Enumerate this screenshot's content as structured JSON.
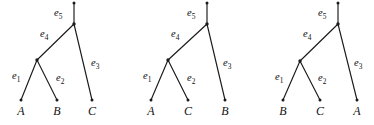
{
  "figure": {
    "name": "three-unrooted-phylogenetic-trees",
    "background_color": "#ffffff",
    "line_color": "#1a1a1a",
    "text_color": "#111111",
    "width": 374,
    "height": 125
  },
  "edge_labels": {
    "e1": {
      "base": "e",
      "sub": "1"
    },
    "e2": {
      "base": "e",
      "sub": "2"
    },
    "e3": {
      "base": "e",
      "sub": "3"
    },
    "e4": {
      "base": "e",
      "sub": "4"
    },
    "e5": {
      "base": "e",
      "sub": "5"
    }
  },
  "trees": [
    {
      "id": "tree-1",
      "leaves": [
        {
          "label": "A",
          "x": 21,
          "y": 115,
          "tip_x": 21,
          "tip_y": 100
        },
        {
          "label": "B",
          "x": 57,
          "y": 115,
          "tip_x": 57,
          "tip_y": 100
        },
        {
          "label": "C",
          "x": 92,
          "y": 115,
          "tip_x": 92,
          "tip_y": 100
        }
      ],
      "nodes": {
        "root_top": {
          "x": 74,
          "y": 3
        },
        "split": {
          "x": 74,
          "y": 24
        },
        "internal": {
          "x": 37,
          "y": 60
        }
      },
      "edges": [
        {
          "name": "e1",
          "from": "internal",
          "to": "leaf-A",
          "label_x": 12,
          "label_y": 79
        },
        {
          "name": "e2",
          "from": "internal",
          "to": "leaf-B",
          "label_x": 56,
          "label_y": 81
        },
        {
          "name": "e3",
          "from": "split",
          "to": "leaf-C",
          "label_x": 91,
          "label_y": 66
        },
        {
          "name": "e4",
          "from": "split",
          "to": "internal",
          "label_x": 40,
          "label_y": 37
        },
        {
          "name": "e5",
          "from": "root_top",
          "to": "split",
          "label_x": 54,
          "label_y": 16
        }
      ]
    },
    {
      "id": "tree-2",
      "leaves": [
        {
          "label": "A",
          "x": 151,
          "y": 115,
          "tip_x": 151,
          "tip_y": 100
        },
        {
          "label": "C",
          "x": 188,
          "y": 115,
          "tip_x": 188,
          "tip_y": 100
        },
        {
          "label": "B",
          "x": 225,
          "y": 115,
          "tip_x": 225,
          "tip_y": 100
        }
      ],
      "nodes": {
        "root_top": {
          "x": 207,
          "y": 3
        },
        "split": {
          "x": 207,
          "y": 24
        },
        "internal": {
          "x": 168,
          "y": 60
        }
      },
      "edges": [
        {
          "name": "e1",
          "from": "internal",
          "to": "leaf-A",
          "label_x": 143,
          "label_y": 79
        },
        {
          "name": "e2",
          "from": "internal",
          "to": "leaf-C",
          "label_x": 187,
          "label_y": 81
        },
        {
          "name": "e3",
          "from": "split",
          "to": "leaf-B",
          "label_x": 223,
          "label_y": 66
        },
        {
          "name": "e4",
          "from": "split",
          "to": "internal",
          "label_x": 171,
          "label_y": 37
        },
        {
          "name": "e5",
          "from": "root_top",
          "to": "split",
          "label_x": 187,
          "label_y": 16
        }
      ]
    },
    {
      "id": "tree-3",
      "leaves": [
        {
          "label": "B",
          "x": 283,
          "y": 115,
          "tip_x": 283,
          "tip_y": 100
        },
        {
          "label": "C",
          "x": 320,
          "y": 115,
          "tip_x": 320,
          "tip_y": 100
        },
        {
          "label": "A",
          "x": 357,
          "y": 115,
          "tip_x": 357,
          "tip_y": 100
        }
      ],
      "nodes": {
        "root_top": {
          "x": 338,
          "y": 3
        },
        "split": {
          "x": 338,
          "y": 24
        },
        "internal": {
          "x": 300,
          "y": 61
        }
      },
      "edges": [
        {
          "name": "e1",
          "from": "internal",
          "to": "leaf-B",
          "label_x": 275,
          "label_y": 80
        },
        {
          "name": "e2",
          "from": "internal",
          "to": "leaf-C",
          "label_x": 318,
          "label_y": 81
        },
        {
          "name": "e3",
          "from": "split",
          "to": "leaf-A",
          "label_x": 354,
          "label_y": 66
        },
        {
          "name": "e4",
          "from": "split",
          "to": "internal",
          "label_x": 303,
          "label_y": 37
        },
        {
          "name": "e5",
          "from": "root_top",
          "to": "split",
          "label_x": 318,
          "label_y": 16
        }
      ]
    }
  ]
}
